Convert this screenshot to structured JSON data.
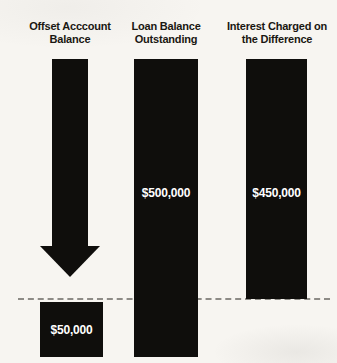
{
  "figure": {
    "columns": [
      {
        "id": "offset-account",
        "header": "Offset Acccount Balance",
        "value_label": "$50,000"
      },
      {
        "id": "loan-balance",
        "header": "Loan Balance Outstanding",
        "value_label": "$500,000"
      },
      {
        "id": "interest-charged",
        "header": "Interest Charged on the Difference",
        "value_label": "$450,000"
      }
    ]
  },
  "chart_data": {
    "type": "bar",
    "categories": [
      "Offset Acccount Balance",
      "Loan Balance Outstanding",
      "Interest Charged on the Difference"
    ],
    "values": [
      50000,
      500000,
      450000
    ],
    "value_labels": [
      "$50,000",
      "$500,000",
      "$450,000"
    ],
    "title": "",
    "xlabel": "",
    "ylabel": "",
    "legend": false,
    "grid": false,
    "annotations": [
      "solid downward arrow in first column pointing from header area to the $50,000 block",
      "horizontal dashed baseline across the figure at the level where the $450,000 bar ends and the $50,000 block begins"
    ]
  },
  "colors": {
    "bar_fill": "#0f0e0c",
    "background": "#f7f5f1",
    "header_text": "#1a1712",
    "value_text": "#ffffff",
    "dashed_line": "#8d8b86"
  }
}
